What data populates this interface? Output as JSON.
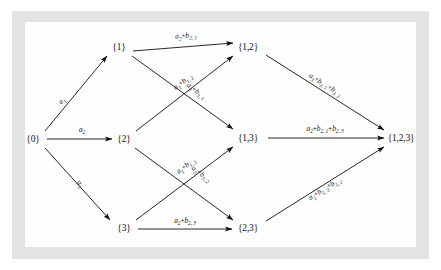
{
  "figure": {
    "type": "directed-acyclic-graph",
    "background_color": "#ffffff",
    "scan_border_color": "#e3e3e3",
    "page_color": "#fefefe",
    "ink_color": "#101010"
  },
  "nodes": [
    {
      "id": "n0",
      "label": "{0}",
      "x": 33,
      "y": 139
    },
    {
      "id": "n1",
      "label": "{1}",
      "x": 119,
      "y": 47
    },
    {
      "id": "n2",
      "label": "{2}",
      "x": 124,
      "y": 139
    },
    {
      "id": "n3",
      "label": "{3}",
      "x": 124,
      "y": 228
    },
    {
      "id": "n12",
      "label": "{1,2}",
      "x": 248,
      "y": 47
    },
    {
      "id": "n13",
      "label": "{1,3}",
      "x": 248,
      "y": 138
    },
    {
      "id": "n23",
      "label": "{2,3}",
      "x": 248,
      "y": 228
    },
    {
      "id": "n123",
      "label": "{1,2,3}",
      "x": 401,
      "y": 138
    }
  ],
  "edges": [
    {
      "id": "e0_1",
      "from": "n0",
      "to": "n1",
      "x1": 45,
      "y1": 131,
      "x2": 107,
      "y2": 56,
      "label": {
        "a": "a",
        "asub": "1",
        "terms": []
      },
      "lx": 62,
      "ly": 101,
      "rot": -50
    },
    {
      "id": "e0_2",
      "from": "n0",
      "to": "n2",
      "x1": 47,
      "y1": 139,
      "x2": 112,
      "y2": 139,
      "label": {
        "a": "a",
        "asub": "2",
        "terms": []
      },
      "lx": 82,
      "ly": 130,
      "rot": 0
    },
    {
      "id": "e0_3",
      "from": "n0",
      "to": "n3",
      "x1": 45,
      "y1": 148,
      "x2": 110,
      "y2": 220,
      "label": {
        "a": "a",
        "asub": "3",
        "terms": []
      },
      "lx": 80,
      "ly": 184,
      "rot": 48
    },
    {
      "id": "e1_12",
      "from": "n1",
      "to": "n12",
      "x1": 133,
      "y1": 51,
      "x2": 233,
      "y2": 43,
      "label": {
        "a": "a",
        "asub": "2",
        "terms": [
          {
            "b": "b",
            "bsub": "2, 1"
          }
        ]
      },
      "lx": 186,
      "ly": 36,
      "rot": -4
    },
    {
      "id": "e1_13",
      "from": "n1",
      "to": "n13",
      "x1": 132,
      "y1": 56,
      "x2": 233,
      "y2": 129,
      "label": {
        "a": "a",
        "asub": "3",
        "terms": [
          {
            "b": "b",
            "bsub": "3, 1"
          }
        ]
      },
      "lx": 196,
      "ly": 91,
      "rot": 36
    },
    {
      "id": "e2_12",
      "from": "n2",
      "to": "n12",
      "x1": 136,
      "y1": 131,
      "x2": 233,
      "y2": 56,
      "label": {
        "a": "a",
        "asub": "1",
        "terms": [
          {
            "b": "b",
            "bsub": "1, 2"
          }
        ]
      },
      "lx": 183,
      "ly": 82,
      "rot": -38
    },
    {
      "id": "e2_23",
      "from": "n2",
      "to": "n23",
      "x1": 135,
      "y1": 148,
      "x2": 233,
      "y2": 220,
      "label": {
        "a": "a",
        "asub": "3",
        "terms": [
          {
            "b": "b",
            "bsub": "3, 2"
          }
        ]
      },
      "lx": 201,
      "ly": 174,
      "rot": 36
    },
    {
      "id": "e3_13",
      "from": "n3",
      "to": "n13",
      "x1": 136,
      "y1": 220,
      "x2": 233,
      "y2": 147,
      "label": {
        "a": "a",
        "asub": "1",
        "terms": [
          {
            "b": "b",
            "bsub": "1, 3"
          }
        ]
      },
      "lx": 186,
      "ly": 166,
      "rot": -37
    },
    {
      "id": "e3_23",
      "from": "n3",
      "to": "n23",
      "x1": 138,
      "y1": 229,
      "x2": 232,
      "y2": 229,
      "label": {
        "a": "a",
        "asub": "2",
        "terms": [
          {
            "b": "b",
            "bsub": "2, 3"
          }
        ]
      },
      "lx": 185,
      "ly": 221,
      "rot": 0
    },
    {
      "id": "e12_123",
      "from": "n12",
      "to": "n123",
      "x1": 266,
      "y1": 55,
      "x2": 384,
      "y2": 130,
      "label": {
        "a": "a",
        "asub": "3",
        "terms": [
          {
            "b": "b",
            "bsub": "3, 1"
          },
          {
            "b": "b",
            "bsub": "3, 2"
          }
        ]
      },
      "lx": 325,
      "ly": 85,
      "rot": 32
    },
    {
      "id": "e13_123",
      "from": "n13",
      "to": "n123",
      "x1": 268,
      "y1": 138,
      "x2": 384,
      "y2": 138,
      "label": {
        "a": "a",
        "asub": "2",
        "terms": [
          {
            "b": "b",
            "bsub": "2, 1"
          },
          {
            "b": "b",
            "bsub": "2, 3"
          }
        ]
      },
      "lx": 325,
      "ly": 129,
      "rot": 0
    },
    {
      "id": "e23_123",
      "from": "n23",
      "to": "n123",
      "x1": 266,
      "y1": 221,
      "x2": 384,
      "y2": 147,
      "label": {
        "a": "a",
        "asub": "1",
        "terms": [
          {
            "b": "b",
            "bsub": "1, 3"
          },
          {
            "b": "b",
            "bsub": "1, 2"
          }
        ]
      },
      "lx": 325,
      "ly": 189,
      "rot": -32
    }
  ]
}
